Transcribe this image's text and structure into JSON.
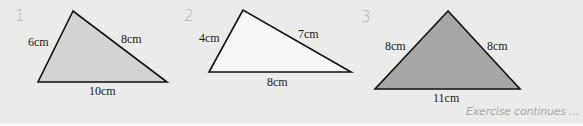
{
  "exercise": {
    "problems": [
      {
        "number": "1",
        "fill": "#d3d3d1",
        "vertices": [
          [
            73,
            11
          ],
          [
            38,
            82
          ],
          [
            167,
            82
          ]
        ],
        "labels": {
          "left": "6cm",
          "right": "8cm",
          "bottom": "10cm"
        }
      },
      {
        "number": "2",
        "fill": "#f7f7f5",
        "vertices": [
          [
            243,
            10
          ],
          [
            209,
            72
          ],
          [
            351,
            72
          ]
        ],
        "labels": {
          "left": "4cm",
          "right": "7cm",
          "bottom": "8cm"
        }
      },
      {
        "number": "3",
        "fill": "#a7a7a5",
        "vertices": [
          [
            448,
            11
          ],
          [
            375,
            89
          ],
          [
            520,
            89
          ]
        ],
        "labels": {
          "left": "8cm",
          "right": "8cm",
          "bottom": "11cm"
        }
      }
    ],
    "footer": "Exercise continues ..."
  }
}
